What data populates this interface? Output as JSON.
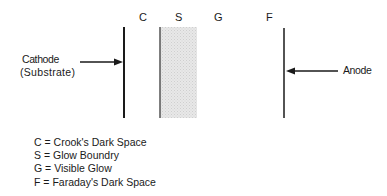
{
  "diagram": {
    "region_labels": [
      {
        "key": "C",
        "x": 140
      },
      {
        "key": "S",
        "x": 175
      },
      {
        "key": "G",
        "x": 215
      },
      {
        "key": "F",
        "x": 266
      }
    ],
    "cathode": {
      "label_line1": "Cathode",
      "label_line2": "(Substrate)"
    },
    "anode": {
      "label": "Anode"
    },
    "legend": [
      {
        "text": "C = Crook's Dark Space"
      },
      {
        "text": "S = Glow Boundry"
      },
      {
        "text": "G = Visible Glow"
      },
      {
        "text": "F = Faraday's Dark Space"
      }
    ],
    "colors": {
      "line": "#1a1a1a",
      "glow_fill": "#e4e4e4",
      "boundary_line": "#555555"
    }
  }
}
